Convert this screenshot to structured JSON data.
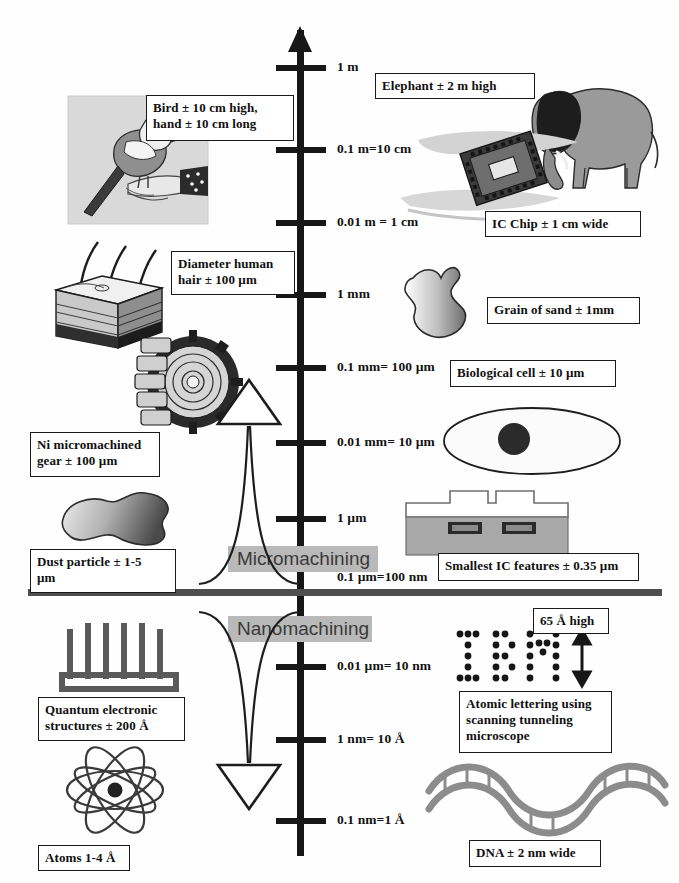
{
  "diagram": {
    "background": "#ffffff",
    "axis_color": "#171717",
    "band_color": "#b9b9b9",
    "divider_color": "#4f4f4f"
  },
  "axis": {
    "ticks": [
      {
        "label": "1 m",
        "y": 68,
        "tick": true
      },
      {
        "label": "0.1 m=10 cm",
        "y": 150,
        "tick": true
      },
      {
        "label": "0.01 m = 1 cm",
        "y": 223,
        "tick": true
      },
      {
        "label": "1 mm",
        "y": 295,
        "tick": true
      },
      {
        "label": "0.1 mm= 100 µm",
        "y": 368,
        "tick": true
      },
      {
        "label": "0.01 mm= 10 µm",
        "y": 443,
        "tick": true
      },
      {
        "label": "1 µm",
        "y": 519,
        "tick": true
      },
      {
        "label": "0.1 µm=100 nm",
        "y": 578,
        "tick": false
      },
      {
        "label": "0.01 µm= 10 nm",
        "y": 667,
        "tick": true
      },
      {
        "label": "1 nm= 10 Å",
        "y": 740,
        "tick": true
      },
      {
        "label": "0.1 nm=1 Å",
        "y": 821,
        "tick": true
      }
    ]
  },
  "bands": [
    {
      "label": "Micromachining",
      "x": 228,
      "y": 546,
      "w": 150
    },
    {
      "label": "Nanomachining",
      "x": 228,
      "y": 616,
      "w": 144
    }
  ],
  "captions": [
    {
      "name": "bird-hand",
      "text": "Bird ± 10 cm high,\nhand ± 10 cm long",
      "x": 146,
      "y": 95,
      "w": 148,
      "h": 46
    },
    {
      "name": "elephant",
      "text": "Elephant ± 2 m high",
      "x": 375,
      "y": 73,
      "w": 160,
      "h": 26
    },
    {
      "name": "ic-chip",
      "text": "IC Chip ± 1 cm wide",
      "x": 485,
      "y": 211,
      "w": 156,
      "h": 26
    },
    {
      "name": "human-hair",
      "text": "Diameter human\nhair ± 100 µm",
      "x": 171,
      "y": 251,
      "w": 124,
      "h": 44
    },
    {
      "name": "grain-of-sand",
      "text": "Grain of sand ± 1mm",
      "x": 487,
      "y": 297,
      "w": 153,
      "h": 27
    },
    {
      "name": "biological-cell",
      "text": "Biological cell ± 10 µm",
      "x": 450,
      "y": 360,
      "w": 166,
      "h": 27
    },
    {
      "name": "ni-gear",
      "text": "Ni micromachined\ngear ± 100 µm",
      "x": 30,
      "y": 432,
      "w": 130,
      "h": 45
    },
    {
      "name": "dust-particle",
      "text": "Dust particle ± 1-5\nµm",
      "x": 30,
      "y": 549,
      "w": 146,
      "h": 44
    },
    {
      "name": "smallest-ic",
      "text": "Smallest IC features ± 0.35 µm",
      "x": 438,
      "y": 553,
      "w": 201,
      "h": 28
    },
    {
      "name": "angstrom-height",
      "text": "65 Å high",
      "x": 533,
      "y": 608,
      "w": 76,
      "h": 23
    },
    {
      "name": "quantum-struct",
      "text": "Quantum electronic\nstructures ± 200 Å",
      "x": 38,
      "y": 697,
      "w": 147,
      "h": 44
    },
    {
      "name": "atomic-lettering",
      "text": "Atomic lettering using\nscanning tunneling\nmicroscope",
      "x": 459,
      "y": 691,
      "w": 153,
      "h": 62
    },
    {
      "name": "atoms",
      "text": "Atoms 1-4 Å",
      "x": 38,
      "y": 845,
      "w": 92,
      "h": 25
    },
    {
      "name": "dna",
      "text": "DNA ± 2 nm wide",
      "x": 469,
      "y": 840,
      "w": 132,
      "h": 27
    }
  ],
  "illustrations": [
    {
      "name": "bird-on-hand-photo",
      "desc": "bird perched on hand"
    },
    {
      "name": "elephant-illustration",
      "desc": "grey elephant"
    },
    {
      "name": "ic-chip-illustration",
      "desc": "integrated circuit chip on hand"
    },
    {
      "name": "skin-hair-illustration",
      "desc": "skin cross-section with hairs"
    },
    {
      "name": "gear-illustration",
      "desc": "micromachined nickel gear"
    },
    {
      "name": "sand-grain-illustration",
      "desc": "grain of sand"
    },
    {
      "name": "cell-illustration",
      "desc": "biological cell with nucleus"
    },
    {
      "name": "dust-particle-illustration",
      "desc": "dust particle blob"
    },
    {
      "name": "ic-cross-section-illustration",
      "desc": "IC cross-section"
    },
    {
      "name": "ibm-atoms-illustration",
      "desc": "IBM spelled with atoms"
    },
    {
      "name": "quantum-comb-illustration",
      "desc": "quantum electronic comb structure"
    },
    {
      "name": "atom-illustration",
      "desc": "atom with orbits"
    },
    {
      "name": "dna-helix-illustration",
      "desc": "DNA double helix"
    },
    {
      "name": "micromachining-arrow",
      "desc": "upward flared arrow"
    },
    {
      "name": "nanomachining-arrow",
      "desc": "downward flared arrow"
    }
  ]
}
